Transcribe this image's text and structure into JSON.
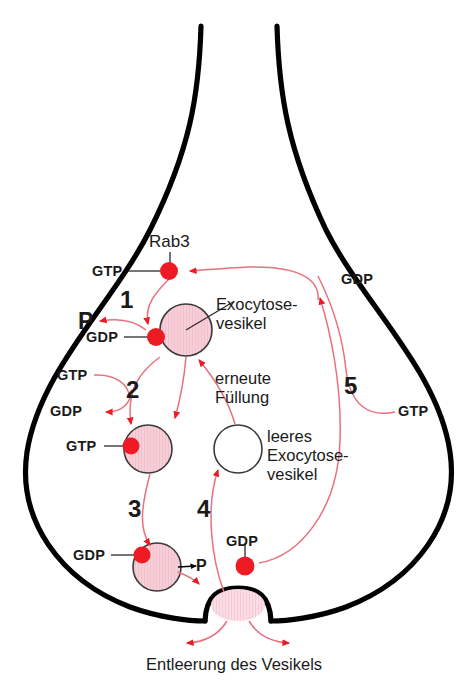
{
  "diagram": {
    "colors": {
      "membrane": "#000000",
      "red": "#ee1b24",
      "curve": "#e8707f",
      "vesicle_fill": "#f7cfd8",
      "vesicle_stroke": "#3a3a3a",
      "pore_fill": "#fbdde5",
      "text": "#1a1a1a"
    },
    "protein": {
      "name": "Rab3"
    },
    "steps": [
      {
        "id": "1",
        "label": "1"
      },
      {
        "id": "2",
        "label": "2"
      },
      {
        "id": "3",
        "label": "3"
      },
      {
        "id": "4",
        "label": "4"
      },
      {
        "id": "5",
        "label": "5"
      }
    ],
    "nucleotides": [
      {
        "id": "gtp-rab3",
        "label": "GTP"
      },
      {
        "id": "gdp-step1",
        "label": "GDP"
      },
      {
        "id": "gtp-step2-in",
        "label": "GTP"
      },
      {
        "id": "gdp-step2-out",
        "label": "GDP"
      },
      {
        "id": "gtp-vesicle2",
        "label": "GTP"
      },
      {
        "id": "gdp-step3",
        "label": "GDP"
      },
      {
        "id": "gdp-pore",
        "label": "GDP"
      },
      {
        "id": "gdp-step5",
        "label": "GDP"
      },
      {
        "id": "gtp-step5",
        "label": "GTP"
      }
    ],
    "phosphates": [
      {
        "id": "p-step1",
        "label": "P"
      },
      {
        "id": "p-step3",
        "label": "P"
      }
    ],
    "annotations": {
      "exocytose_vesikel": "Exocytose-\nvesikel",
      "erneute_fuellung": "erneute\nFüllung",
      "leeres_vesikel": "leeres\nExocytose-\nvesikel",
      "entleerung": "Entleerung des Vesikels"
    }
  }
}
